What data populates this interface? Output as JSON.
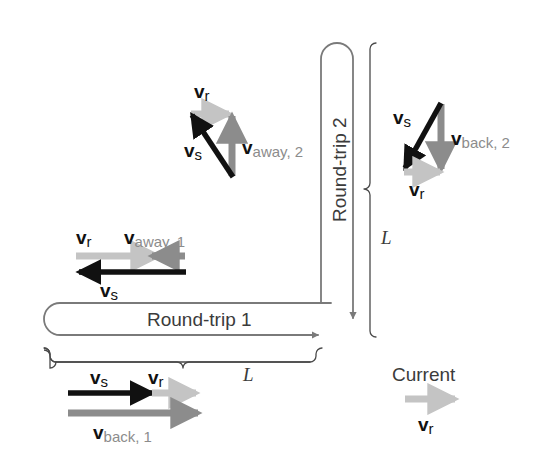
{
  "figure": {
    "background": "#ffffff"
  },
  "colors": {
    "black": "#111111",
    "dark_gray": "#6e6e6e",
    "mid_gray": "#8c8c8c",
    "light_gray": "#c4c4c4",
    "path_gray": "#7a7a7a",
    "text_gray": "#3b3b3b"
  },
  "paths": {
    "round_trip_1": {
      "label": "Round-trip 1",
      "orientation": "horizontal",
      "arrow_direction": "right"
    },
    "round_trip_2": {
      "label": "Round-trip 2",
      "orientation": "vertical",
      "arrow_direction": "down"
    }
  },
  "braces": {
    "horizontal": {
      "label": "L"
    },
    "vertical": {
      "label": "L"
    }
  },
  "vector_groups": {
    "away_2": {
      "name": "round-trip-2-outbound",
      "vectors": [
        {
          "id": "vr",
          "symbol": "v",
          "subscript": "r",
          "color": "#c4c4c4",
          "direction": "right"
        },
        {
          "id": "vs",
          "symbol": "v",
          "subscript": "s",
          "color": "#111111",
          "direction": "up-left"
        },
        {
          "id": "vaway2",
          "symbol": "v",
          "subscript": "away, 2",
          "color": "#8c8c8c",
          "direction": "up"
        }
      ],
      "labels": {
        "vr": {
          "bold": "v",
          "sub": "r"
        },
        "vs": {
          "bold": "v",
          "sub": "s"
        },
        "vaway2": {
          "bold": "v",
          "sub": "away, 2"
        }
      }
    },
    "back_2": {
      "name": "round-trip-2-return",
      "vectors": [
        {
          "id": "vs",
          "symbol": "v",
          "subscript": "s",
          "color": "#111111",
          "direction": "down-left"
        },
        {
          "id": "vback2",
          "symbol": "v",
          "subscript": "back, 2",
          "color": "#8c8c8c",
          "direction": "down"
        },
        {
          "id": "vr",
          "symbol": "v",
          "subscript": "r",
          "color": "#c4c4c4",
          "direction": "right"
        }
      ],
      "labels": {
        "vs": {
          "bold": "v",
          "sub": "s"
        },
        "vback2": {
          "bold": "v",
          "sub": "back, 2"
        },
        "vr": {
          "bold": "v",
          "sub": "r"
        }
      }
    },
    "away_1": {
      "name": "round-trip-1-outbound",
      "vectors": [
        {
          "id": "vr",
          "symbol": "v",
          "subscript": "r",
          "color": "#c4c4c4",
          "direction": "right"
        },
        {
          "id": "vaway1",
          "symbol": "v",
          "subscript": "away, 1",
          "color": "#8c8c8c",
          "direction": "left"
        },
        {
          "id": "vs",
          "symbol": "v",
          "subscript": "s",
          "color": "#111111",
          "direction": "left"
        }
      ],
      "labels": {
        "vr": {
          "bold": "v",
          "sub": "r"
        },
        "vaway1": {
          "bold": "v",
          "sub": "away, 1"
        },
        "vs": {
          "bold": "v",
          "sub": "s"
        }
      }
    },
    "back_1": {
      "name": "round-trip-1-return",
      "vectors": [
        {
          "id": "vs",
          "symbol": "v",
          "subscript": "s",
          "color": "#111111",
          "direction": "right"
        },
        {
          "id": "vr",
          "symbol": "v",
          "subscript": "r",
          "color": "#c4c4c4",
          "direction": "right"
        },
        {
          "id": "vback1",
          "symbol": "v",
          "subscript": "back, 1",
          "color": "#8c8c8c",
          "direction": "right"
        }
      ],
      "labels": {
        "vs": {
          "bold": "v",
          "sub": "s"
        },
        "vr": {
          "bold": "v",
          "sub": "r"
        },
        "vback1": {
          "bold": "v",
          "sub": "back, 1"
        }
      }
    }
  },
  "legend": {
    "title": "Current",
    "arrow_direction": "right",
    "arrow_color": "#c4c4c4",
    "symbol": {
      "bold": "v",
      "sub": "r"
    }
  }
}
